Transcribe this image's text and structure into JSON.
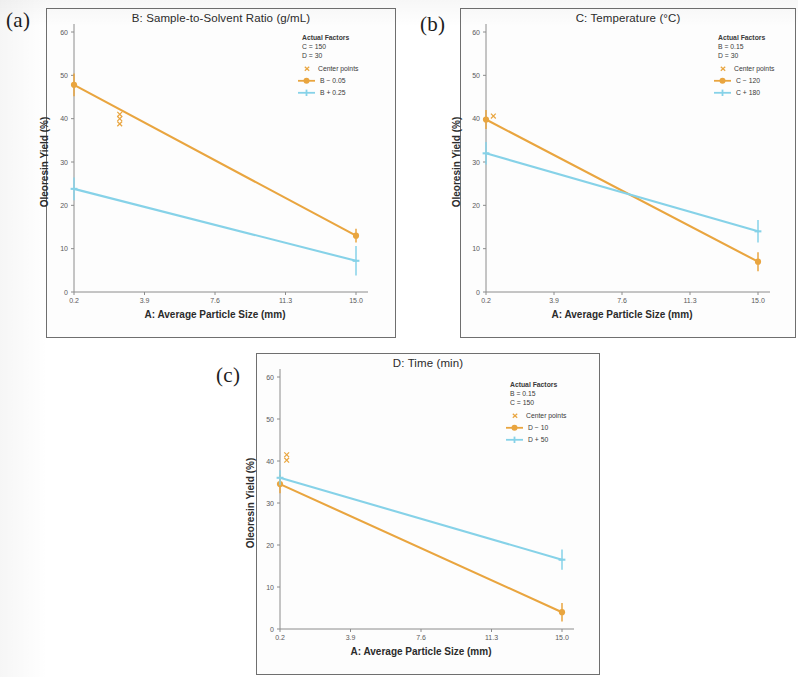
{
  "figure": {
    "colors": {
      "orange": "#E9A53F",
      "blue": "#86D2E8",
      "axis": "#8c8c8c",
      "frame": "#6f6f6f",
      "text": "#2b2b2b"
    },
    "shared": {
      "xlabel": "A: Average Particle Size (mm)",
      "ylabel": "Oleoresin Yield (%)",
      "xticks": [
        "0.2",
        "3.9",
        "7.6",
        "11.3",
        "15.0"
      ],
      "yticks": [
        "0",
        "10",
        "20",
        "30",
        "40",
        "50",
        "60"
      ],
      "legend_header": "Actual Factors",
      "center_points_label": "Center points"
    },
    "panels": [
      {
        "tag": "(a)",
        "title": "B: Sample-to-Solvent Ratio (g/mL)",
        "factors": [
          "C = 150",
          "D = 30"
        ],
        "series_labels": [
          "B − 0.05",
          "B + 0.25"
        ]
      },
      {
        "tag": "(b)",
        "title": "C: Temperature (°C)",
        "factors": [
          "B = 0.15",
          "D = 30"
        ],
        "series_labels": [
          "C − 120",
          "C + 180"
        ]
      },
      {
        "tag": "(c)",
        "title": "D: Time (min)",
        "factors": [
          "B = 0.15",
          "C = 150"
        ],
        "series_labels": [
          "D − 10",
          "D + 50"
        ]
      }
    ]
  },
  "chart_data": [
    {
      "type": "line",
      "panel": "(a)",
      "title": "B: Sample-to-Solvent Ratio (g/mL)",
      "xlabel": "A: Average Particle Size (mm)",
      "ylabel": "Oleoresin Yield (%)",
      "xlim": [
        0.2,
        15.0
      ],
      "ylim": [
        0,
        60
      ],
      "xticks": [
        0.2,
        3.9,
        7.6,
        11.3,
        15.0
      ],
      "yticks": [
        0,
        10,
        20,
        30,
        40,
        50,
        60
      ],
      "grid": false,
      "legend_position": "top-right",
      "annotations": [
        "Actual Factors",
        "C = 150",
        "D = 30"
      ],
      "series": [
        {
          "name": "B − 0.05",
          "color": "#E9A53F",
          "x": [
            0.2,
            15.0
          ],
          "values": [
            47.8,
            13.0
          ],
          "errors": [
            2.6,
            1.6
          ]
        },
        {
          "name": "B + 0.25",
          "color": "#86D2E8",
          "x": [
            0.2,
            15.0
          ],
          "values": [
            23.8,
            7.2
          ],
          "errors": [
            2.6,
            3.4
          ]
        }
      ],
      "center_points": {
        "name": "Center points",
        "color": "#E9A53F",
        "x": [
          2.6,
          2.6,
          2.6
        ],
        "values": [
          41.0,
          40.0,
          38.8
        ]
      }
    },
    {
      "type": "line",
      "panel": "(b)",
      "title": "C: Temperature (°C)",
      "xlabel": "A: Average Particle Size (mm)",
      "ylabel": "Oleoresin Yield (%)",
      "xlim": [
        0.2,
        15.0
      ],
      "ylim": [
        0,
        60
      ],
      "xticks": [
        0.2,
        3.9,
        7.6,
        11.3,
        15.0
      ],
      "yticks": [
        0,
        10,
        20,
        30,
        40,
        50,
        60
      ],
      "grid": false,
      "legend_position": "top-right",
      "annotations": [
        "Actual Factors",
        "B = 0.15",
        "D = 30"
      ],
      "series": [
        {
          "name": "C − 120",
          "color": "#E9A53F",
          "x": [
            0.2,
            15.0
          ],
          "values": [
            39.8,
            7.0
          ],
          "errors": [
            2.2,
            2.2
          ]
        },
        {
          "name": "C + 180",
          "color": "#86D2E8",
          "x": [
            0.2,
            15.0
          ],
          "values": [
            32.0,
            14.0
          ],
          "errors": [
            2.6,
            2.6
          ]
        }
      ],
      "center_points": {
        "name": "Center points",
        "color": "#E9A53F",
        "x": [
          0.6
        ],
        "values": [
          40.6
        ]
      }
    },
    {
      "type": "line",
      "panel": "(c)",
      "title": "D: Time (min)",
      "xlabel": "A: Average Particle Size (mm)",
      "ylabel": "Oleoresin Yield (%)",
      "xlim": [
        0.2,
        15.0
      ],
      "ylim": [
        0,
        60
      ],
      "xticks": [
        0.2,
        3.9,
        7.6,
        11.3,
        15.0
      ],
      "yticks": [
        0,
        10,
        20,
        30,
        40,
        50,
        60
      ],
      "grid": false,
      "legend_position": "top-right",
      "annotations": [
        "Actual Factors",
        "B = 0.15",
        "C = 150"
      ],
      "series": [
        {
          "name": "D − 10",
          "color": "#E9A53F",
          "x": [
            0.2,
            15.0
          ],
          "values": [
            34.5,
            4.0
          ],
          "errors": [
            2.2,
            2.2
          ]
        },
        {
          "name": "D + 50",
          "color": "#86D2E8",
          "x": [
            0.2,
            15.0
          ],
          "values": [
            36.0,
            16.5
          ],
          "errors": [
            1.8,
            2.4
          ]
        }
      ],
      "center_points": {
        "name": "Center points",
        "color": "#E9A53F",
        "x": [
          0.55,
          0.55
        ],
        "values": [
          41.5,
          40.2
        ]
      }
    }
  ]
}
